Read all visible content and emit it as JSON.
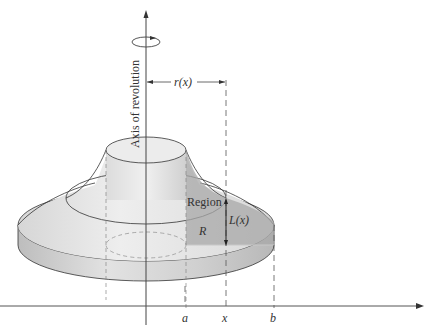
{
  "figure": {
    "type": "solid of revolution (shell method)",
    "labels": {
      "axis": "Axis of revolution",
      "radius": "r(x)",
      "region": "Region",
      "region_name": "R",
      "height": "L(x)",
      "tick_a": "a",
      "tick_x": "x",
      "tick_b": "b"
    },
    "colors": {
      "line": "#333333",
      "solid_light": "#e6e6e6",
      "solid_mid": "#cfcfcf",
      "solid_dark": "#b5b5b5",
      "region": "#a9a9a9",
      "background": "#ffffff"
    }
  }
}
